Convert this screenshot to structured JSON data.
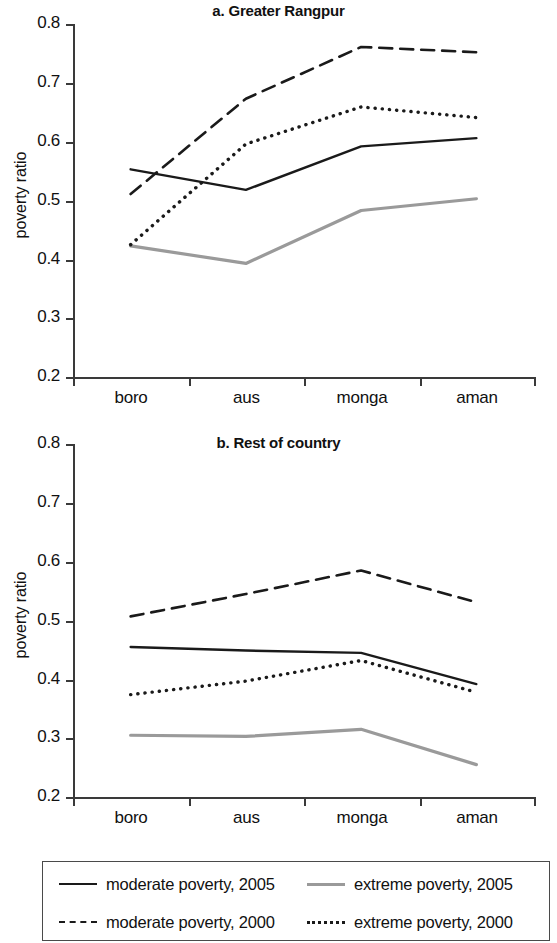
{
  "chart_data": [
    {
      "type": "line",
      "title": "a. Greater Rangpur",
      "xlabel": "",
      "ylabel": "poverty ratio",
      "categories": [
        "boro",
        "aus",
        "monga",
        "aman"
      ],
      "ylim": [
        0.2,
        0.8
      ],
      "yticks": [
        "0.2",
        "0.3",
        "0.4",
        "0.5",
        "0.6",
        "0.7",
        "0.8"
      ],
      "grid": false,
      "legend_position": "bottom",
      "series": [
        {
          "name": "moderate poverty, 2005",
          "style": "solid",
          "color": "#1a1a1a",
          "values": [
            0.553,
            0.518,
            0.592,
            0.606
          ]
        },
        {
          "name": "moderate poverty, 2000",
          "style": "dashed",
          "color": "#1a1a1a",
          "values": [
            0.511,
            0.673,
            0.761,
            0.752
          ]
        },
        {
          "name": "extreme poverty, 2005",
          "style": "solid",
          "color": "#9a9a9a",
          "values": [
            0.423,
            0.393,
            0.483,
            0.503
          ]
        },
        {
          "name": "extreme poverty, 2000",
          "style": "dotted",
          "color": "#1a1a1a",
          "values": [
            0.425,
            0.596,
            0.659,
            0.641
          ]
        }
      ]
    },
    {
      "type": "line",
      "title": "b. Rest of country",
      "xlabel": "",
      "ylabel": "poverty ratio",
      "categories": [
        "boro",
        "aus",
        "monga",
        "aman"
      ],
      "ylim": [
        0.2,
        0.8
      ],
      "yticks": [
        "0.2",
        "0.3",
        "0.4",
        "0.5",
        "0.6",
        "0.7",
        "0.8"
      ],
      "grid": false,
      "legend_position": "bottom",
      "series": [
        {
          "name": "moderate poverty, 2005",
          "style": "solid",
          "color": "#1a1a1a",
          "values": [
            0.455,
            0.449,
            0.445,
            0.392
          ]
        },
        {
          "name": "moderate poverty, 2000",
          "style": "dashed",
          "color": "#1a1a1a",
          "values": [
            0.507,
            0.545,
            0.585,
            0.531
          ]
        },
        {
          "name": "extreme poverty, 2005",
          "style": "solid",
          "color": "#9a9a9a",
          "values": [
            0.305,
            0.303,
            0.315,
            0.255
          ]
        },
        {
          "name": "extreme poverty, 2000",
          "style": "dotted",
          "color": "#1a1a1a",
          "values": [
            0.374,
            0.397,
            0.432,
            0.378
          ]
        }
      ]
    }
  ],
  "panel_a": {
    "title": "a. Greater Rangpur",
    "ylabel": "poverty ratio",
    "yticks": [
      "0.8",
      "0.7",
      "0.6",
      "0.5",
      "0.4",
      "0.3",
      "0.2"
    ],
    "xticks": [
      "boro",
      "aus",
      "monga",
      "aman"
    ]
  },
  "panel_b": {
    "title": "b. Rest of country",
    "ylabel": "poverty ratio",
    "yticks": [
      "0.8",
      "0.7",
      "0.6",
      "0.5",
      "0.4",
      "0.3",
      "0.2"
    ],
    "xticks": [
      "boro",
      "aus",
      "monga",
      "aman"
    ]
  },
  "legend": {
    "items": [
      {
        "label": "moderate poverty, 2005",
        "swatch": "solid-black-line-icon"
      },
      {
        "label": "extreme poverty, 2005",
        "swatch": "solid-gray-line-icon"
      },
      {
        "label": "moderate poverty, 2000",
        "swatch": "dashed-black-line-icon"
      },
      {
        "label": "extreme poverty, 2000",
        "swatch": "dotted-black-line-icon"
      }
    ]
  },
  "colors": {
    "moderate": "#1a1a1a",
    "extreme": "#9a9a9a",
    "axis": "#3a3a3a",
    "background": "#ffffff"
  }
}
